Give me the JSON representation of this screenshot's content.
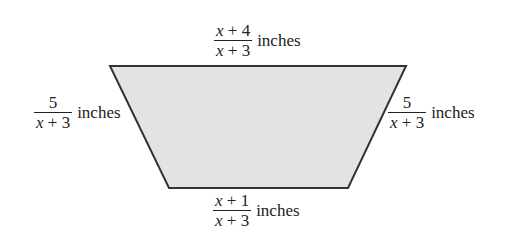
{
  "figure": {
    "shape": "trapezoid",
    "fill_color": "#e3e3e3",
    "stroke_color": "#333333",
    "vertices": {
      "top_left": [
        110,
        66
      ],
      "top_right": [
        406,
        66
      ],
      "bottom_right": [
        348,
        188
      ],
      "bottom_left": [
        169,
        188
      ]
    }
  },
  "labels": {
    "top": {
      "numerator_var": "x",
      "numerator_rest": " + 4",
      "denominator_var": "x",
      "denominator_rest": " + 3",
      "unit": "inches"
    },
    "left": {
      "numerator": "5",
      "denominator_var": "x",
      "denominator_rest": " + 3",
      "unit": "inches"
    },
    "right": {
      "numerator": "5",
      "denominator_var": "x",
      "denominator_rest": " + 3",
      "unit": "inches"
    },
    "bottom": {
      "numerator_var": "x",
      "numerator_rest": " + 1",
      "denominator_var": "x",
      "denominator_rest": " + 3",
      "unit": "inches"
    }
  }
}
